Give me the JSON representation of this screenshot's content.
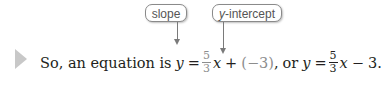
{
  "callouts": {
    "slope": "slope",
    "y_intercept_var": "y",
    "y_intercept_rest": "-intercept"
  },
  "sentence": {
    "lead": "So, an equation is",
    "eq1": {
      "lhs": "y",
      "equals": "=",
      "slope_num": "5",
      "slope_den": "3",
      "x": "x",
      "plus": "+",
      "intercept": "(−3)",
      "tail": ","
    },
    "or": "or",
    "eq2": {
      "lhs": "y",
      "equals": "=",
      "slope_num": "5",
      "slope_den": "3",
      "x": "x",
      "minus": "−",
      "const": "3",
      "end": "."
    }
  },
  "colors": {
    "highlight": "#8d8d8d",
    "text": "#231f20",
    "callout_border": "#8a8a8a"
  }
}
